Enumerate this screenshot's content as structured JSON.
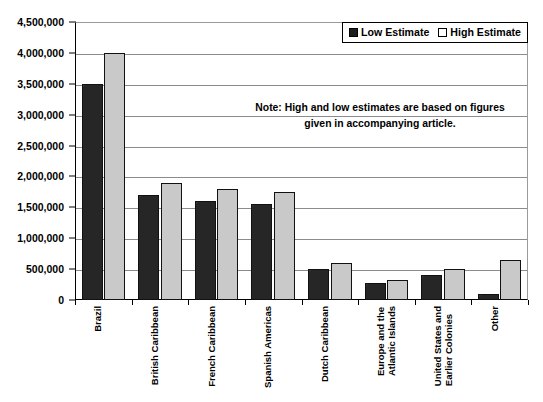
{
  "chart_data": {
    "type": "bar",
    "title": "",
    "subtitle": "",
    "xlabel": "",
    "ylabel": "",
    "ylim": [
      0,
      4500000
    ],
    "ytick_values": [
      0,
      500000,
      1000000,
      1500000,
      2000000,
      2500000,
      3000000,
      3500000,
      4000000,
      4500000
    ],
    "ytick_labels": [
      "0",
      "500,000",
      "1,000,000",
      "1,500,000",
      "2,000,000",
      "2,500,000",
      "3,000,000",
      "3,500,000",
      "4,000,000",
      "4,500,000"
    ],
    "grid": true,
    "legend_position": "top-right",
    "categories": [
      "Brazil",
      "British Caribbean",
      "French Caribbean",
      "Spanish Americas",
      "Dutch Caribbean",
      "Europe and the\nAtlantic Islands",
      "United States and\nEarlier Colonies",
      "Other"
    ],
    "series": [
      {
        "name": "Low Estimate",
        "color": "#262626",
        "values": [
          3500000,
          1700000,
          1600000,
          1550000,
          500000,
          280000,
          400000,
          100000
        ]
      },
      {
        "name": "High Estimate",
        "color": "#c9c9c9",
        "values": [
          4000000,
          1900000,
          1800000,
          1750000,
          600000,
          330000,
          500000,
          650000
        ]
      }
    ],
    "annotations": [
      {
        "name": "note",
        "line1": "Note: High and low estimates are based on figures",
        "line2": "given in accompanying article."
      }
    ]
  },
  "legend": {
    "items": [
      {
        "label": "Low Estimate",
        "swatch": "filled-dark-square-icon"
      },
      {
        "label": "High Estimate",
        "swatch": "outlined-light-square-icon"
      }
    ]
  }
}
